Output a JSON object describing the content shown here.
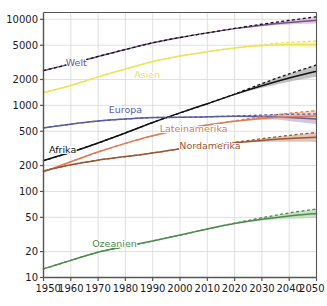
{
  "chart_data": {
    "type": "line",
    "title": "",
    "subtitle": "",
    "xlabel": "",
    "ylabel": "",
    "yscale": "log",
    "xlim": [
      1950,
      2050
    ],
    "ylim": [
      10,
      12000
    ],
    "grid": true,
    "legend": "inline-labels",
    "x_ticks": [
      "1950",
      "1960",
      "1970",
      "1980",
      "1990",
      "2000",
      "2010",
      "2020",
      "2030",
      "2040",
      "2050"
    ],
    "y_ticks": [
      "10",
      "20",
      "50",
      "100",
      "200",
      "500",
      "1000",
      "2000",
      "5000",
      "10000"
    ],
    "x": [
      1950,
      1960,
      1970,
      1980,
      1990,
      2000,
      2010,
      2020,
      2030,
      2040,
      2050
    ],
    "series": [
      {
        "name": "Welt",
        "label": "Welt",
        "color": "#7a4f8c",
        "band_color": "#c9a8d6",
        "label_x": 1962,
        "label_y": 3100,
        "values": [
          2536,
          3034,
          3700,
          4458,
          5327,
          6143,
          6957,
          7795,
          8548,
          9199,
          9735
        ],
        "upper": [
          2536,
          3034,
          3700,
          4458,
          5327,
          6143,
          6957,
          7830,
          8780,
          9720,
          10700
        ],
        "lower": [
          2536,
          3034,
          3700,
          4458,
          5327,
          6143,
          6957,
          7760,
          8330,
          8700,
          8920
        ]
      },
      {
        "name": "Asien",
        "label": "Asien",
        "color": "#ece35a",
        "band_color": "#f6f0a8",
        "label_x": 1988,
        "label_y": 2250,
        "values": [
          1405,
          1705,
          2143,
          2642,
          3226,
          3741,
          4210,
          4641,
          4947,
          5100,
          5100
        ],
        "upper": [
          1405,
          1705,
          2143,
          2642,
          3226,
          3741,
          4210,
          4665,
          5080,
          5400,
          5600
        ],
        "lower": [
          1405,
          1705,
          2143,
          2642,
          3226,
          3741,
          4210,
          4620,
          4830,
          4820,
          4680
        ]
      },
      {
        "name": "Afrika",
        "label": "Afrika",
        "color": "#111111",
        "band_color": "#9c9c9c",
        "label_x": 1957,
        "label_y": 300,
        "values": [
          228,
          285,
          366,
          478,
          632,
          818,
          1044,
          1341,
          1688,
          2077,
          2489
        ],
        "upper": [
          228,
          285,
          366,
          478,
          632,
          818,
          1044,
          1352,
          1790,
          2320,
          2950
        ],
        "lower": [
          228,
          285,
          366,
          478,
          632,
          818,
          1044,
          1332,
          1600,
          1880,
          2150
        ]
      },
      {
        "name": "Europa",
        "label": "Europa",
        "color": "#5b5ba0",
        "band_color": "#a9a9d6",
        "label_x": 1980,
        "label_y": 880,
        "values": [
          549,
          605,
          657,
          694,
          721,
          726,
          736,
          748,
          741,
          722,
          696
        ],
        "upper": [
          549,
          605,
          657,
          694,
          721,
          726,
          736,
          752,
          772,
          788,
          796
        ],
        "lower": [
          549,
          605,
          657,
          694,
          721,
          726,
          736,
          744,
          712,
          660,
          606
        ]
      },
      {
        "name": "Lateinamerika",
        "label": "Lateinamerika",
        "color": "#e07a52",
        "band_color": "#f3bfa6",
        "label_x": 2005,
        "label_y": 530,
        "values": [
          169,
          221,
          287,
          362,
          443,
          522,
          591,
          654,
          706,
          739,
          751
        ],
        "upper": [
          169,
          221,
          287,
          362,
          443,
          522,
          591,
          660,
          740,
          810,
          870
        ],
        "lower": [
          169,
          221,
          287,
          362,
          443,
          522,
          591,
          648,
          676,
          676,
          654
        ]
      },
      {
        "name": "Nordamerika",
        "label": "Nordamerika",
        "color": "#9b5535",
        "band_color": "#cfa58f",
        "label_x": 2011,
        "label_y": 330,
        "values": [
          173,
          204,
          231,
          254,
          280,
          313,
          343,
          369,
          392,
          411,
          425
        ],
        "upper": [
          173,
          204,
          231,
          254,
          280,
          313,
          343,
          372,
          410,
          448,
          484
        ],
        "lower": [
          173,
          204,
          231,
          254,
          280,
          313,
          343,
          366,
          375,
          377,
          373
        ]
      },
      {
        "name": "Ozeanien",
        "label": "Ozeanien",
        "color": "#4d8a4d",
        "band_color": "#a8cda8",
        "label_x": 1976,
        "label_y": 24.5,
        "values": [
          12.6,
          15.8,
          19.7,
          22.9,
          26.6,
          31.1,
          36.6,
          42.4,
          47.6,
          52.0,
          55.6
        ],
        "upper": [
          12.6,
          15.8,
          19.7,
          22.9,
          26.6,
          31.1,
          36.6,
          42.8,
          49.5,
          56.3,
          62.5
        ],
        "lower": [
          12.6,
          15.8,
          19.7,
          22.9,
          26.6,
          31.1,
          36.6,
          42.0,
          45.8,
          48.0,
          49.2
        ]
      }
    ],
    "colors": {
      "grid": "#d8d8d8",
      "axis": "#555555",
      "background": "#ffffff",
      "tick_label": "#1a1a1a"
    }
  }
}
